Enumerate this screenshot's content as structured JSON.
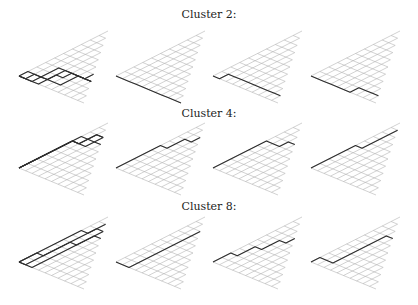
{
  "figure": {
    "lattice": {
      "steps": 10,
      "up_vector": [
        8.9,
        -4.5
      ],
      "down_vector": [
        6.5,
        2.7
      ],
      "grid_color": "#b4b4b4",
      "path_color": "#2e2e2e"
    },
    "panel_x_origins": [
      19,
      116,
      213,
      311
    ],
    "clusters": [
      {
        "title": "Cluster 2:",
        "title_y": 9,
        "origin_y": 76,
        "panels": [
          {
            "paths": [
              "DDUUUDDDDD",
              "UDDDUUDDDD",
              "DUDDUDUDDU",
              "DDDUDDUUDD"
            ]
          },
          {
            "paths": [
              "DDDDDDDDDD"
            ]
          },
          {
            "paths": [
              "DUDDDDDDDD"
            ]
          },
          {
            "paths": [
              "DDDDDDUDDD"
            ]
          }
        ]
      },
      {
        "title": "Cluster 4:",
        "title_y": 108,
        "origin_y": 168,
        "panels": [
          {
            "paths": [
              "UUUUUUDUUD",
              "UUUUUUDDUU",
              "UUUUUUUDUD",
              "UUUUUUDUDD"
            ]
          },
          {
            "paths": [
              "UUUUUDUUDU"
            ]
          },
          {
            "paths": [
              "UUUUUUDDUD"
            ]
          },
          {
            "paths": [
              "UUUUUDUUUU"
            ]
          }
        ]
      },
      {
        "title": "Cluster 8:",
        "title_y": 201,
        "origin_y": 262,
        "panels": [
          {
            "paths": [
              "DUUUUUUUUU",
              "UUDUUUDUUU",
              "DDUUUUUUUD",
              "UUUUUUUDUD"
            ]
          },
          {
            "paths": [
              "DDUUUUUUUU"
            ]
          },
          {
            "paths": [
              "UUDUUDUUDU"
            ]
          },
          {
            "paths": [
              "UDDUUUUUUD"
            ]
          }
        ]
      }
    ]
  }
}
